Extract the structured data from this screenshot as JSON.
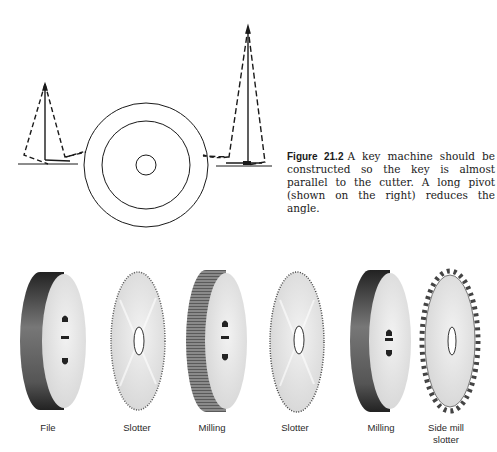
{
  "figure": {
    "number": "Figure 21.2",
    "caption": "A key machine should be constructed so the key is almost parallel to the cutter. A long pivot (shown on the right) reduces the angle."
  },
  "diagram": {
    "elements": [
      {
        "name": "short-pivot",
        "side": "left"
      },
      {
        "name": "cutter-wheel",
        "rings": 3
      },
      {
        "name": "long-pivot",
        "side": "right"
      }
    ]
  },
  "cutters": [
    {
      "label": "File",
      "type": "file",
      "cx": 48
    },
    {
      "label": "Slotter",
      "type": "slotter",
      "cx": 137
    },
    {
      "label": "Milling",
      "type": "milling",
      "cx": 212
    },
    {
      "label": "Slotter",
      "type": "slotter",
      "cx": 295
    },
    {
      "label": "Milling",
      "type": "milling",
      "cx": 381
    },
    {
      "label": "Side mill\nslotter",
      "label_line1": "Side mill",
      "label_line2": "slotter",
      "type": "side-mill-slotter",
      "cx": 446
    }
  ],
  "colors": {
    "line": "#1a1a1a",
    "face": "#e6e6e6",
    "rim_dark": "#3a3a3a"
  }
}
